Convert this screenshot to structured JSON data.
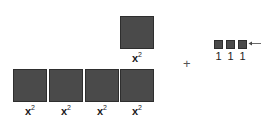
{
  "tiles": {
    "top": {
      "label_base": "x",
      "label_exp": "2"
    },
    "bottom": [
      {
        "label_base": "x",
        "label_exp": "2"
      },
      {
        "label_base": "x",
        "label_exp": "2"
      },
      {
        "label_base": "x",
        "label_exp": "2"
      },
      {
        "label_base": "x",
        "label_exp": "2"
      }
    ]
  },
  "operator": "+",
  "unit_tiles": [
    {
      "label": "1"
    },
    {
      "label": "1"
    },
    {
      "label": "1"
    }
  ],
  "colors": {
    "tile": "#4a4a4a"
  }
}
